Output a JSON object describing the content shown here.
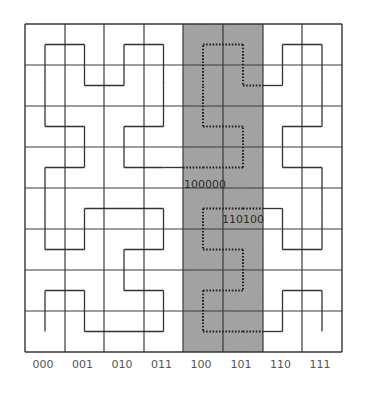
{
  "diagram": {
    "grid": {
      "cols": 8,
      "rows": 8,
      "col_bounds": [
        25,
        65,
        104,
        144,
        183,
        223,
        263,
        302,
        342
      ],
      "row_bounds": [
        24,
        65,
        106,
        147,
        188,
        229,
        270,
        311,
        352
      ]
    },
    "shaded_band": {
      "from_col": 4,
      "to_col": 6,
      "color": "#a9a9a9"
    },
    "curve_points_col_row": [
      [
        0,
        7
      ],
      [
        0,
        6
      ],
      [
        1,
        6
      ],
      [
        1,
        7
      ],
      [
        2,
        7
      ],
      [
        3,
        7
      ],
      [
        3,
        6
      ],
      [
        2,
        6
      ],
      [
        2,
        5
      ],
      [
        3,
        5
      ],
      [
        3,
        4
      ],
      [
        2,
        4
      ],
      [
        1,
        4
      ],
      [
        1,
        5
      ],
      [
        0,
        5
      ],
      [
        0,
        4
      ],
      [
        0,
        3
      ],
      [
        1,
        3
      ],
      [
        1,
        2
      ],
      [
        0,
        2
      ],
      [
        0,
        1
      ],
      [
        0,
        0
      ],
      [
        1,
        0
      ],
      [
        1,
        1
      ],
      [
        2,
        1
      ],
      [
        2,
        0
      ],
      [
        3,
        0
      ],
      [
        3,
        1
      ],
      [
        3,
        2
      ],
      [
        2,
        2
      ],
      [
        2,
        3
      ],
      [
        3,
        3
      ],
      [
        4,
        3
      ],
      [
        5,
        3
      ],
      [
        5,
        2
      ],
      [
        4,
        2
      ],
      [
        4,
        1
      ],
      [
        4,
        0
      ],
      [
        5,
        0
      ],
      [
        5,
        1
      ],
      [
        6,
        1
      ],
      [
        6,
        0
      ],
      [
        7,
        0
      ],
      [
        7,
        1
      ],
      [
        7,
        2
      ],
      [
        6,
        2
      ],
      [
        6,
        3
      ],
      [
        7,
        3
      ],
      [
        7,
        4
      ],
      [
        7,
        5
      ],
      [
        6,
        5
      ],
      [
        6,
        4
      ],
      [
        5,
        4
      ],
      [
        4,
        4
      ],
      [
        4,
        5
      ],
      [
        5,
        5
      ],
      [
        5,
        6
      ],
      [
        4,
        6
      ],
      [
        4,
        7
      ],
      [
        5,
        7
      ],
      [
        6,
        7
      ],
      [
        6,
        6
      ],
      [
        7,
        6
      ],
      [
        7,
        7
      ]
    ],
    "colors": {
      "grid": "#3a3a3a",
      "curve": "#333333",
      "dotted_curve": "#222222",
      "axis_text": "#555555"
    },
    "annotations": [
      {
        "text": "100000",
        "x": 184,
        "y": 188
      },
      {
        "text": "110100",
        "x": 222,
        "y": 223
      }
    ],
    "x_axis_labels": [
      "000",
      "001",
      "010",
      "011",
      "100",
      "101",
      "110",
      "111"
    ],
    "x_axis_label_y": 368
  }
}
